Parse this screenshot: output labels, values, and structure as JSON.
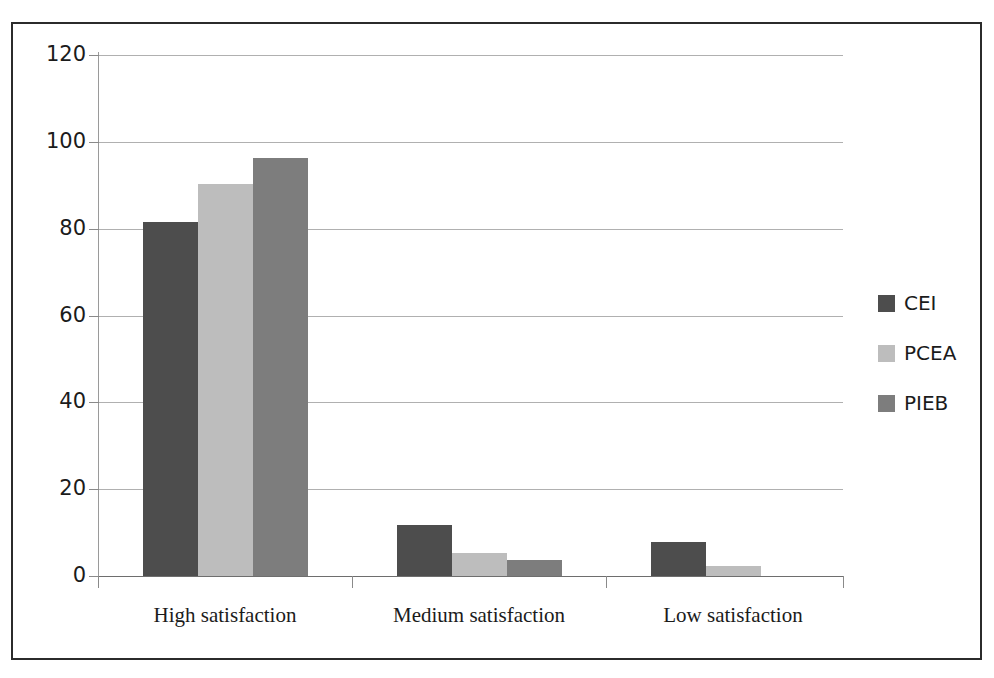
{
  "chart_data": {
    "type": "bar",
    "title": "",
    "subtitle": "",
    "xlabel": "",
    "ylabel": "",
    "categories": [
      "High satisfaction",
      "Medium satisfaction",
      "Low satisfaction"
    ],
    "series": [
      {
        "name": "CEI",
        "color": "#4d4d4d",
        "values": [
          81.5,
          11.8,
          7.8
        ]
      },
      {
        "name": "PCEA",
        "color": "#bdbdbd",
        "values": [
          90.2,
          5.2,
          2.4
        ]
      },
      {
        "name": "PIEB",
        "color": "#7d7d7d",
        "values": [
          96.2,
          3.8,
          0
        ]
      }
    ],
    "ylim": [
      0,
      120
    ],
    "yticks": [
      0,
      20,
      40,
      60,
      80,
      100,
      120
    ],
    "ytick_labels": [
      "0",
      "20",
      "40",
      "60",
      "80",
      "100",
      "120"
    ],
    "grid": true,
    "grid_axis": "y",
    "legend": {
      "position": "right",
      "entries": [
        {
          "label": "CEI",
          "color": "#4d4d4d"
        },
        {
          "label": "PCEA",
          "color": "#bdbdbd"
        },
        {
          "label": "PIEB",
          "color": "#7d7d7d"
        }
      ]
    },
    "frame": {
      "border": true,
      "border_color": "#2b2b2b"
    },
    "background_color": "#ffffff"
  }
}
